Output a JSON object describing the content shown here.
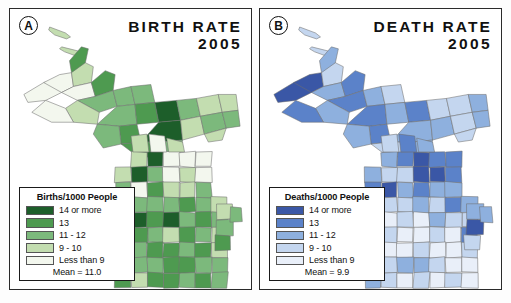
{
  "figure": {
    "background": "#fdfdfd",
    "frame_color": "#2a2a2a"
  },
  "panels": [
    {
      "tag": "A",
      "title_line1": "BIRTH RATE",
      "title_line2": "2005",
      "legend": {
        "title": "Births/1000 People",
        "rows": [
          {
            "color": "#1d5e2a",
            "label": "14 or more"
          },
          {
            "color": "#4e9a50",
            "label": "13"
          },
          {
            "color": "#7cb97c",
            "label": "11 - 12"
          },
          {
            "color": "#c3ddb0",
            "label": "9 - 10"
          },
          {
            "color": "#f3f7ee",
            "label": "Less than 9"
          }
        ],
        "mean": "Mean = 11.0"
      },
      "palette": [
        "#1d5e2a",
        "#4e9a50",
        "#7cb97c",
        "#c3ddb0",
        "#f3f7ee"
      ]
    },
    {
      "tag": "B",
      "title_line1": "DEATH RATE",
      "title_line2": "2005",
      "legend": {
        "title": "Deaths/1000 People",
        "rows": [
          {
            "color": "#3a57a6",
            "label": "14 or more"
          },
          {
            "color": "#5b82c9",
            "label": "13"
          },
          {
            "color": "#8eb0de",
            "label": "11 - 12"
          },
          {
            "color": "#c4d6ef",
            "label": "9 - 10"
          },
          {
            "color": "#e9eff9",
            "label": "Less than 9"
          }
        ],
        "mean": "Mean = 9.9"
      },
      "palette": [
        "#3a57a6",
        "#5b82c9",
        "#8eb0de",
        "#c4d6ef",
        "#e9eff9"
      ]
    }
  ],
  "chart_data": {
    "type": "heatmap",
    "subtitle": "Two-panel county choropleth map of Michigan",
    "units": "events per 1000 people",
    "legend_position": "bottom-left of each panel",
    "classes": [
      "14 or more",
      "13",
      "11 - 12",
      "9 - 10",
      "Less than 9"
    ],
    "series": [
      {
        "name": "BIRTH RATE 2005",
        "panel": "A",
        "legend_title": "Births/1000 People",
        "mean": 11.0,
        "mean_label": "Mean = 11.0",
        "color_ramp": [
          "#1d5e2a",
          "#4e9a50",
          "#7cb97c",
          "#c3ddb0",
          "#f3f7ee"
        ],
        "class_of_region": {
          "upper_peninsula_west": "9 - 10",
          "upper_peninsula_central": "14 or more",
          "upper_peninsula_east": "11 - 12",
          "northern_lower_peninsula": "9 - 10",
          "central_lower_peninsula": "11 - 12",
          "southern_lower_peninsula": "13",
          "southwest_lower_peninsula": "14 or more"
        }
      },
      {
        "name": "DEATH RATE 2005",
        "panel": "B",
        "legend_title": "Deaths/1000 People",
        "mean": 9.9,
        "mean_label": "Mean = 9.9",
        "color_ramp": [
          "#3a57a6",
          "#5b82c9",
          "#8eb0de",
          "#c4d6ef",
          "#e9eff9"
        ],
        "class_of_region": {
          "upper_peninsula_west": "14 or more",
          "upper_peninsula_central": "13",
          "upper_peninsula_east": "11 - 12",
          "northern_lower_peninsula": "14 or more",
          "central_lower_peninsula": "11 - 12",
          "southern_lower_peninsula": "Less than 9",
          "southwest_lower_peninsula": "9 - 10"
        }
      }
    ]
  }
}
